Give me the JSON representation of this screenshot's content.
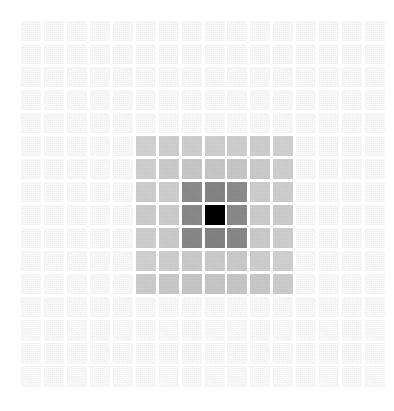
{
  "figure": {
    "kind": "heatmap-grid",
    "background_color": "#ffffff",
    "cell_gap_px": 3,
    "cell_size_px": 20,
    "grid_origin_x_px": 21,
    "grid_origin_y_px": 21
  },
  "chart_data": {
    "type": "heatmap",
    "title": "",
    "subtitle": "",
    "xlabel": "",
    "ylabel": "",
    "grid": false,
    "legend": null,
    "annotations": [],
    "rows": 16,
    "cols": 16,
    "x": [
      0,
      1,
      2,
      3,
      4,
      5,
      6,
      7,
      8,
      9,
      10,
      11,
      12,
      13,
      14,
      15
    ],
    "y": [
      0,
      1,
      2,
      3,
      4,
      5,
      6,
      7,
      8,
      9,
      10,
      11,
      12,
      13,
      14,
      15
    ],
    "xtick_labels": [],
    "ytick_labels": [],
    "zlim": [
      0,
      1
    ],
    "colormap": "grayscale-reversed",
    "peak_cell": {
      "row": 8,
      "col": 8,
      "value": 1.0,
      "color": "#000000"
    },
    "level_colors": {
      "background": "#fbfbfb",
      "ring3": "#d0d0d0",
      "ring2": "#c4c4c4",
      "ring1": "#8a8a8a",
      "peak": "#000000"
    },
    "values": [
      [
        0.0,
        0.0,
        0.0,
        0.0,
        0.0,
        0.0,
        0.0,
        0.0,
        0.0,
        0.0,
        0.0,
        0.0,
        0.0,
        0.0,
        0.0,
        0.0
      ],
      [
        0.0,
        0.0,
        0.0,
        0.0,
        0.0,
        0.0,
        0.0,
        0.0,
        0.0,
        0.0,
        0.0,
        0.0,
        0.0,
        0.0,
        0.0,
        0.0
      ],
      [
        0.0,
        0.0,
        0.0,
        0.0,
        0.0,
        0.0,
        0.0,
        0.0,
        0.0,
        0.0,
        0.0,
        0.0,
        0.0,
        0.0,
        0.0,
        0.0
      ],
      [
        0.0,
        0.0,
        0.0,
        0.0,
        0.0,
        0.0,
        0.0,
        0.0,
        0.0,
        0.0,
        0.0,
        0.0,
        0.0,
        0.0,
        0.0,
        0.0
      ],
      [
        0.0,
        0.0,
        0.0,
        0.0,
        0.0,
        0.0,
        0.0,
        0.0,
        0.0,
        0.0,
        0.0,
        0.0,
        0.0,
        0.0,
        0.0,
        0.0
      ],
      [
        0.0,
        0.0,
        0.0,
        0.0,
        0.0,
        0.18,
        0.18,
        0.18,
        0.18,
        0.18,
        0.18,
        0.18,
        0.0,
        0.0,
        0.0,
        0.0
      ],
      [
        0.0,
        0.0,
        0.0,
        0.0,
        0.0,
        0.18,
        0.22,
        0.22,
        0.22,
        0.22,
        0.22,
        0.18,
        0.0,
        0.0,
        0.0,
        0.0
      ],
      [
        0.0,
        0.0,
        0.0,
        0.0,
        0.0,
        0.18,
        0.22,
        0.46,
        0.46,
        0.46,
        0.22,
        0.18,
        0.0,
        0.0,
        0.0,
        0.0
      ],
      [
        0.0,
        0.0,
        0.0,
        0.0,
        0.0,
        0.18,
        0.22,
        0.46,
        1.0,
        0.46,
        0.22,
        0.18,
        0.0,
        0.0,
        0.0,
        0.0
      ],
      [
        0.0,
        0.0,
        0.0,
        0.0,
        0.0,
        0.18,
        0.22,
        0.46,
        0.46,
        0.46,
        0.22,
        0.18,
        0.0,
        0.0,
        0.0,
        0.0
      ],
      [
        0.0,
        0.0,
        0.0,
        0.0,
        0.0,
        0.18,
        0.22,
        0.22,
        0.22,
        0.22,
        0.22,
        0.18,
        0.0,
        0.0,
        0.0,
        0.0
      ],
      [
        0.0,
        0.0,
        0.0,
        0.0,
        0.0,
        0.18,
        0.18,
        0.18,
        0.18,
        0.18,
        0.18,
        0.18,
        0.0,
        0.0,
        0.0,
        0.0
      ],
      [
        0.0,
        0.0,
        0.0,
        0.0,
        0.0,
        0.0,
        0.0,
        0.0,
        0.0,
        0.0,
        0.0,
        0.0,
        0.0,
        0.0,
        0.0,
        0.0
      ],
      [
        0.0,
        0.0,
        0.0,
        0.0,
        0.0,
        0.0,
        0.0,
        0.0,
        0.0,
        0.0,
        0.0,
        0.0,
        0.0,
        0.0,
        0.0,
        0.0
      ],
      [
        0.0,
        0.0,
        0.0,
        0.0,
        0.0,
        0.0,
        0.0,
        0.0,
        0.0,
        0.0,
        0.0,
        0.0,
        0.0,
        0.0,
        0.0,
        0.0
      ],
      [
        0.0,
        0.0,
        0.0,
        0.0,
        0.0,
        0.0,
        0.0,
        0.0,
        0.0,
        0.0,
        0.0,
        0.0,
        0.0,
        0.0,
        0.0,
        0.0
      ]
    ],
    "cell_colors": [
      [
        "#fbfbfb",
        "#fbfbfb",
        "#fbfbfb",
        "#fbfbfb",
        "#fbfbfb",
        "#fbfbfb",
        "#fbfbfb",
        "#fbfbfb",
        "#fbfbfb",
        "#fbfbfb",
        "#fbfbfb",
        "#fbfbfb",
        "#fbfbfb",
        "#fbfbfb",
        "#fbfbfb",
        "#fbfbfb"
      ],
      [
        "#fbfbfb",
        "#fbfbfb",
        "#fbfbfb",
        "#fbfbfb",
        "#fbfbfb",
        "#fbfbfb",
        "#fbfbfb",
        "#fbfbfb",
        "#fbfbfb",
        "#fbfbfb",
        "#fbfbfb",
        "#fbfbfb",
        "#fbfbfb",
        "#fbfbfb",
        "#fbfbfb",
        "#fbfbfb"
      ],
      [
        "#fbfbfb",
        "#fbfbfb",
        "#fbfbfb",
        "#fbfbfb",
        "#fbfbfb",
        "#fbfbfb",
        "#fbfbfb",
        "#fbfbfb",
        "#fbfbfb",
        "#fbfbfb",
        "#fbfbfb",
        "#fbfbfb",
        "#fbfbfb",
        "#fbfbfb",
        "#fbfbfb",
        "#fbfbfb"
      ],
      [
        "#fbfbfb",
        "#fbfbfb",
        "#fbfbfb",
        "#fbfbfb",
        "#fbfbfb",
        "#fbfbfb",
        "#fbfbfb",
        "#fbfbfb",
        "#fbfbfb",
        "#fbfbfb",
        "#fbfbfb",
        "#fbfbfb",
        "#fbfbfb",
        "#fbfbfb",
        "#fbfbfb",
        "#fbfbfb"
      ],
      [
        "#fbfbfb",
        "#fbfbfb",
        "#fbfbfb",
        "#fbfbfb",
        "#fbfbfb",
        "#fbfbfb",
        "#fbfbfb",
        "#fbfbfb",
        "#fbfbfb",
        "#fbfbfb",
        "#fbfbfb",
        "#fbfbfb",
        "#fbfbfb",
        "#fbfbfb",
        "#fbfbfb",
        "#fbfbfb"
      ],
      [
        "#fbfbfb",
        "#fbfbfb",
        "#fbfbfb",
        "#fbfbfb",
        "#fbfbfb",
        "#d2d2d2",
        "#d0d0d0",
        "#d0d0d0",
        "#d0d0d0",
        "#d0d0d0",
        "#d0d0d0",
        "#d2d2d2",
        "#fbfbfb",
        "#fbfbfb",
        "#fbfbfb",
        "#fbfbfb"
      ],
      [
        "#fbfbfb",
        "#fbfbfb",
        "#fbfbfb",
        "#fbfbfb",
        "#fbfbfb",
        "#d0d0d0",
        "#cccccc",
        "#c8c8c8",
        "#c8c8c8",
        "#c8c8c8",
        "#cccccc",
        "#d0d0d0",
        "#fbfbfb",
        "#fbfbfb",
        "#fbfbfb",
        "#fbfbfb"
      ],
      [
        "#fbfbfb",
        "#fbfbfb",
        "#fbfbfb",
        "#fbfbfb",
        "#fbfbfb",
        "#cfcfcf",
        "#cfcfcf",
        "#8c8c8c",
        "#858585",
        "#8c8c8c",
        "#cfcfcf",
        "#cfcfcf",
        "#fbfbfb",
        "#fbfbfb",
        "#fbfbfb",
        "#fbfbfb"
      ],
      [
        "#fbfbfb",
        "#fbfbfb",
        "#fbfbfb",
        "#fbfbfb",
        "#fbfbfb",
        "#cdcdcd",
        "#cdcdcd",
        "#8a8a8a",
        "#000000",
        "#8a8a8a",
        "#cdcdcd",
        "#cdcdcd",
        "#fbfbfb",
        "#fbfbfb",
        "#fbfbfb",
        "#fbfbfb"
      ],
      [
        "#fbfbfb",
        "#fbfbfb",
        "#fbfbfb",
        "#fbfbfb",
        "#fbfbfb",
        "#cfcfcf",
        "#cbcbcb",
        "#898989",
        "#838383",
        "#898989",
        "#cbcbcb",
        "#cfcfcf",
        "#fbfbfb",
        "#fbfbfb",
        "#fbfbfb",
        "#fbfbfb"
      ],
      [
        "#fbfbfb",
        "#fbfbfb",
        "#fbfbfb",
        "#fbfbfb",
        "#fbfbfb",
        "#d2d2d2",
        "#cfcfcf",
        "#cbcbcb",
        "#cbcbcb",
        "#cbcbcb",
        "#cfcfcf",
        "#d2d2d2",
        "#fbfbfb",
        "#fbfbfb",
        "#fbfbfb",
        "#fbfbfb"
      ],
      [
        "#fbfbfb",
        "#fbfbfb",
        "#fbfbfb",
        "#fbfbfb",
        "#fbfbfb",
        "#cecece",
        "#cacaca",
        "#c8c8c8",
        "#c8c8c8",
        "#c8c8c8",
        "#cacaca",
        "#cecece",
        "#fbfbfb",
        "#fbfbfb",
        "#fbfbfb",
        "#fbfbfb"
      ],
      [
        "#fbfbfb",
        "#fbfbfb",
        "#fbfbfb",
        "#fbfbfb",
        "#fbfbfb",
        "#fbfbfb",
        "#fbfbfb",
        "#fbfbfb",
        "#fbfbfb",
        "#fbfbfb",
        "#fbfbfb",
        "#fbfbfb",
        "#fbfbfb",
        "#fbfbfb",
        "#fbfbfb",
        "#fbfbfb"
      ],
      [
        "#fbfbfb",
        "#fbfbfb",
        "#fbfbfb",
        "#fbfbfb",
        "#fbfbfb",
        "#fbfbfb",
        "#fbfbfb",
        "#fbfbfb",
        "#fbfbfb",
        "#fbfbfb",
        "#fbfbfb",
        "#fbfbfb",
        "#fbfbfb",
        "#fbfbfb",
        "#fbfbfb",
        "#fbfbfb"
      ],
      [
        "#fbfbfb",
        "#fbfbfb",
        "#fbfbfb",
        "#fbfbfb",
        "#fbfbfb",
        "#fbfbfb",
        "#fbfbfb",
        "#fbfbfb",
        "#fbfbfb",
        "#fbfbfb",
        "#fbfbfb",
        "#fbfbfb",
        "#fbfbfb",
        "#fbfbfb",
        "#fbfbfb",
        "#fbfbfb"
      ],
      [
        "#fbfbfb",
        "#fbfbfb",
        "#fbfbfb",
        "#fbfbfb",
        "#fbfbfb",
        "#fbfbfb",
        "#fbfbfb",
        "#fbfbfb",
        "#fbfbfb",
        "#fbfbfb",
        "#fbfbfb",
        "#fbfbfb",
        "#fbfbfb",
        "#fbfbfb",
        "#fbfbfb",
        "#fbfbfb"
      ]
    ]
  }
}
